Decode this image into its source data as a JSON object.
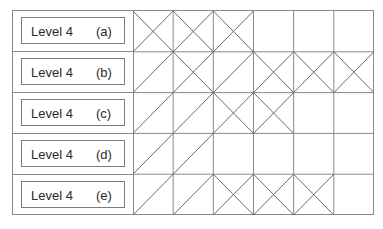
{
  "diagram": {
    "type": "grid-pattern",
    "columns": 6,
    "rows": [
      {
        "label": "Level 4",
        "letter": "(a)",
        "cells": [
          "X",
          "X",
          "X",
          "",
          "",
          ""
        ]
      },
      {
        "label": "Level 4",
        "letter": "(b)",
        "cells": [
          "/",
          "X",
          "/",
          "X",
          "X",
          "X"
        ]
      },
      {
        "label": "Level 4",
        "letter": "(c)",
        "cells": [
          "/",
          "/",
          "X",
          "X",
          "",
          ""
        ]
      },
      {
        "label": "Level 4",
        "letter": "(d)",
        "cells": [
          "/",
          "/",
          "",
          "",
          "",
          ""
        ]
      },
      {
        "label": "Level 4",
        "letter": "(e)",
        "cells": [
          "/",
          "/",
          "X",
          "X",
          "X",
          ""
        ]
      }
    ],
    "colors": {
      "line": "#8a8a8a",
      "stroke": "#6a6a6a",
      "text": "#2a2a2a"
    }
  }
}
